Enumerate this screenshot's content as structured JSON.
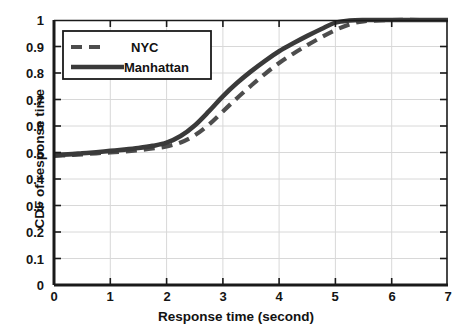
{
  "chart_data": {
    "type": "line",
    "title": "",
    "xlabel": "Response time (second)",
    "ylabel": "CDF of response time",
    "xlim": [
      0,
      7
    ],
    "ylim": [
      0,
      1
    ],
    "xticks": [
      "0",
      "1",
      "2",
      "3",
      "4",
      "5",
      "6",
      "7"
    ],
    "yticks": [
      "0",
      "0.1",
      "0.2",
      "0.3",
      "0.4",
      "0.5",
      "0.6",
      "0.7",
      "0.8",
      "0.9",
      "1"
    ],
    "grid": true,
    "legend_position": "upper left",
    "series": [
      {
        "name": "NYC",
        "style": "dashed",
        "color": "#4d4d4d",
        "x": [
          0,
          0.25,
          0.5,
          0.75,
          1.0,
          1.25,
          1.5,
          1.75,
          2.0,
          2.25,
          2.5,
          2.75,
          3.0,
          3.25,
          3.5,
          3.75,
          4.0,
          4.25,
          4.5,
          4.75,
          5.0,
          5.25,
          5.5,
          6.0,
          6.5,
          7.0
        ],
        "y": [
          0.487,
          0.49,
          0.493,
          0.497,
          0.5,
          0.504,
          0.509,
          0.515,
          0.523,
          0.538,
          0.565,
          0.605,
          0.655,
          0.705,
          0.752,
          0.797,
          0.838,
          0.873,
          0.905,
          0.935,
          0.962,
          0.983,
          0.995,
          1.0,
          1.0,
          1.0
        ]
      },
      {
        "name": "Manhattan",
        "style": "solid",
        "color": "#3a3a3a",
        "x": [
          0,
          0.25,
          0.5,
          0.75,
          1.0,
          1.25,
          1.5,
          1.75,
          2.0,
          2.25,
          2.5,
          2.75,
          3.0,
          3.25,
          3.5,
          3.75,
          4.0,
          4.25,
          4.5,
          4.75,
          5.0,
          5.25,
          5.5,
          6.0,
          6.5,
          7.0
        ],
        "y": [
          0.49,
          0.493,
          0.497,
          0.501,
          0.506,
          0.511,
          0.517,
          0.525,
          0.537,
          0.562,
          0.602,
          0.655,
          0.712,
          0.762,
          0.806,
          0.846,
          0.882,
          0.912,
          0.94,
          0.966,
          0.99,
          0.998,
          1.0,
          1.0,
          1.0,
          1.0
        ]
      }
    ]
  },
  "legend": {
    "items": [
      {
        "label": "NYC",
        "style": "dashed"
      },
      {
        "label": "Manhattan",
        "style": "solid"
      }
    ]
  },
  "axes": {
    "x_title": "Response time (second)",
    "y_title": "CDF of response time",
    "x_ticks": [
      "0",
      "1",
      "2",
      "3",
      "4",
      "5",
      "6",
      "7"
    ],
    "y_ticks": [
      "1",
      "0.9",
      "0.8",
      "0.7",
      "0.6",
      "0.5",
      "0.4",
      "0.3",
      "0.2",
      "0.1",
      "0"
    ]
  },
  "colors": {
    "axis": "#1a1a1a",
    "grid": "#d8d8d8",
    "series_solid": "#3a3a3a",
    "series_dashed": "#4d4d4d",
    "background": "#ffffff"
  }
}
